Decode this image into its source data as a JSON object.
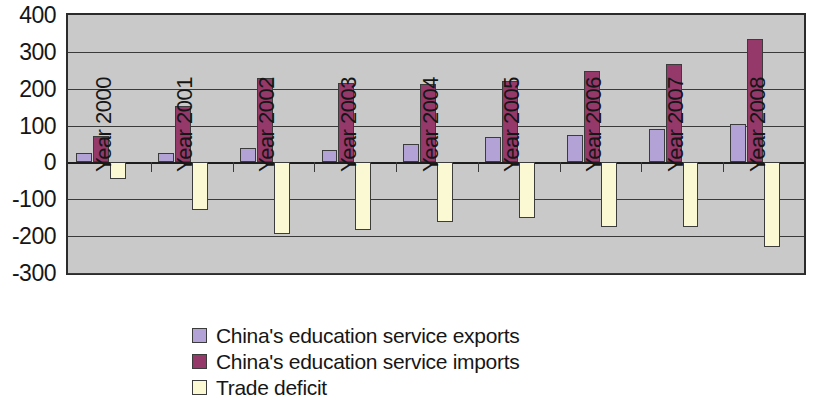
{
  "chart_data": {
    "type": "bar",
    "title": "",
    "subtitle": "",
    "xlabel": "",
    "ylabel": "",
    "ylim": [
      -300,
      400
    ],
    "ytick_step": 100,
    "yticks": [
      "400",
      "300",
      "200",
      "100",
      "0",
      "-100",
      "-200",
      "-300"
    ],
    "grid": true,
    "legend_position": "bottom",
    "categories": [
      "Year 2000",
      "Year 2001",
      "Year 2002",
      "Year 2003",
      "Year 2004",
      "Year 2005",
      "Year 2006",
      "Year 2007",
      "Year 2008"
    ],
    "series": [
      {
        "name": "China's education service exports",
        "color": "#b3a2d6",
        "values": [
          25,
          25,
          40,
          35,
          50,
          68,
          75,
          92,
          105
        ]
      },
      {
        "name": "China's education service imports",
        "color": "#95386a",
        "values": [
          72,
          152,
          228,
          215,
          212,
          220,
          248,
          266,
          335
        ]
      },
      {
        "name": "Trade deficit",
        "color": "#fbf8d4",
        "values": [
          -45,
          -130,
          -195,
          -182,
          -163,
          -152,
          -175,
          -175,
          -230
        ]
      }
    ]
  },
  "legend": {
    "items": [
      {
        "label": "China's education service exports",
        "swatch": "exports"
      },
      {
        "label": "China's education service imports",
        "swatch": "imports"
      },
      {
        "label": "Trade deficit",
        "swatch": "deficit"
      }
    ]
  },
  "colors": {
    "exports": "#b3a2d6",
    "imports": "#95386a",
    "deficit": "#fbf8d4",
    "plot_background": "#c9c9c9",
    "axis": "#2b2b2b",
    "text": "#161616"
  }
}
